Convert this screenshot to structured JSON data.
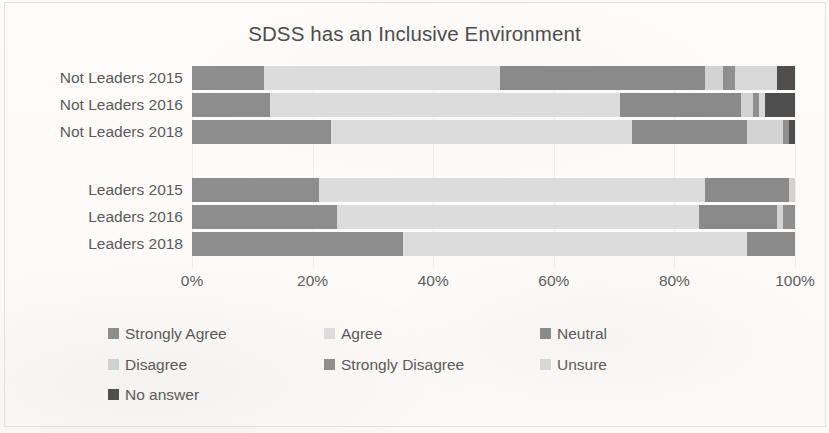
{
  "chart_data": {
    "type": "bar",
    "subtype": "100% stacked horizontal bar",
    "title": "SDSS has an Inclusive Environment",
    "xlabel": "",
    "ylabel": "",
    "xlim": [
      0,
      100
    ],
    "xticks": [
      "0%",
      "20%",
      "40%",
      "60%",
      "80%",
      "100%"
    ],
    "xtick_values": [
      0,
      20,
      40,
      60,
      80,
      100
    ],
    "grid": true,
    "legend_position": "bottom",
    "orientation": "horizontal",
    "categories": [
      "Not Leaders 2015",
      "Not Leaders 2016",
      "Not Leaders 2018",
      "Leaders 2015",
      "Leaders 2016",
      "Leaders 2018"
    ],
    "series": [
      {
        "name": "Strongly Agree",
        "color": "#8d8d8d",
        "values": [
          12,
          13,
          23,
          21,
          24,
          35
        ]
      },
      {
        "name": "Agree",
        "color": "#dcdcdc",
        "values": [
          39,
          58,
          50,
          64,
          60,
          57
        ]
      },
      {
        "name": "Neutral",
        "color": "#8a8a8a",
        "values": [
          34,
          20,
          19,
          14,
          13,
          8
        ]
      },
      {
        "name": "Disagree",
        "color": "#d2d2d2",
        "values": [
          3,
          2,
          6,
          1,
          1,
          0
        ]
      },
      {
        "name": "Strongly Disagree",
        "color": "#8f8f8f",
        "values": [
          2,
          1,
          1,
          0,
          2,
          0
        ]
      },
      {
        "name": "Unsure",
        "color": "#d8d8d8",
        "values": [
          7,
          1,
          0,
          0,
          0,
          0
        ]
      },
      {
        "name": "No answer",
        "color": "#4f4f4f",
        "values": [
          3,
          5,
          1,
          0,
          0,
          0
        ]
      }
    ]
  },
  "legend": {
    "items": [
      {
        "label": "Strongly Agree",
        "color": "#8d8d8d"
      },
      {
        "label": "Agree",
        "color": "#dcdcdc"
      },
      {
        "label": "Neutral",
        "color": "#8a8a8a"
      },
      {
        "label": "Disagree",
        "color": "#d2d2d2"
      },
      {
        "label": "Strongly Disagree",
        "color": "#8f8f8f"
      },
      {
        "label": "Unsure",
        "color": "#d8d8d8"
      },
      {
        "label": "No answer",
        "color": "#4f4f4f"
      }
    ]
  }
}
